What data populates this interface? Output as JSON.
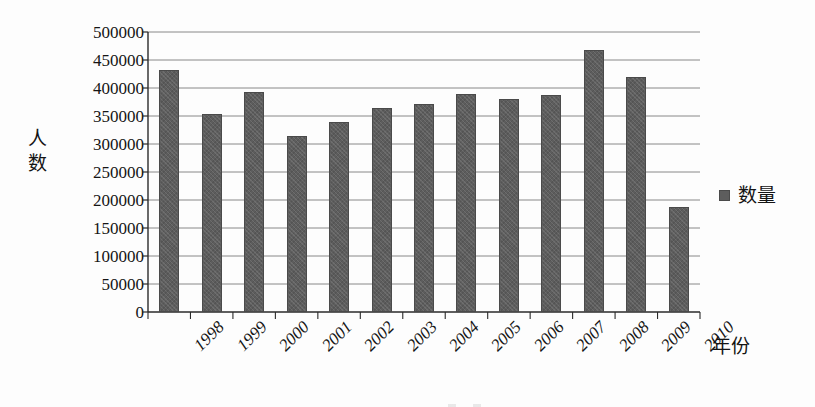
{
  "chart_data": {
    "type": "bar",
    "title": "",
    "xlabel": "年份",
    "ylabel": "人数",
    "categories": [
      "1998",
      "1999",
      "2000",
      "2001",
      "2002",
      "2003",
      "2004",
      "2005",
      "2006",
      "2007",
      "2008",
      "2009",
      "2010"
    ],
    "values": [
      432000,
      353000,
      393000,
      315000,
      340000,
      365000,
      372000,
      390000,
      380000,
      387000,
      467000,
      420000,
      188000
    ],
    "series": [
      {
        "name": "数量",
        "values": [
          432000,
          353000,
          393000,
          315000,
          340000,
          365000,
          372000,
          390000,
          380000,
          387000,
          467000,
          420000,
          188000
        ],
        "color": "#5d5d5d"
      }
    ],
    "ylim": [
      0,
      500000
    ],
    "ytick_step": 50000,
    "ytick_labels": [
      "500000",
      "450000",
      "400000",
      "350000",
      "300000",
      "250000",
      "200000",
      "150000",
      "100000",
      "50000",
      "0"
    ],
    "ytick_values": [
      500000,
      450000,
      400000,
      350000,
      300000,
      250000,
      200000,
      150000,
      100000,
      50000,
      0
    ],
    "grid": true,
    "grid_axis": "y",
    "legend_position": "right",
    "xtick_rotation": -45
  },
  "legend": {
    "entries": [
      {
        "label": "数量",
        "color": "#5d5d5d",
        "marker": "square"
      }
    ]
  },
  "axes": {
    "y_title_chars": [
      "人",
      "数"
    ],
    "x_title": "年份"
  },
  "colors": {
    "bar": "#5d5d5d",
    "bar_edge": "#4a4a4a",
    "grid": "#7a7a7a",
    "axis": "#2a2a2a",
    "background": "#fdfdfd",
    "text": "#151515"
  }
}
